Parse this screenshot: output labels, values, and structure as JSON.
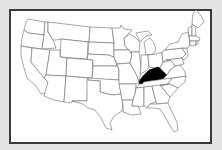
{
  "map": {
    "title": "United States map",
    "highlighted_state": "Kentucky",
    "highlight_color": "#000000",
    "state_fill": "#ffffff",
    "state_stroke": "#6a6a6a",
    "background": "#e4e4e4",
    "frame_border": "#3a3a3a"
  }
}
